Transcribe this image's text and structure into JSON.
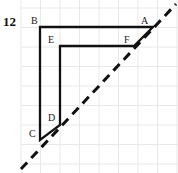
{
  "figure": {
    "problem_number": "12",
    "background_color": "#ffffff",
    "width": 178,
    "height": 173
  },
  "grid": {
    "color": "#e8e8ea",
    "line_width": 1,
    "spacing": 19.5,
    "x_start": 21,
    "y_start": 8,
    "columns": 8,
    "rows": 8,
    "visible": true
  },
  "shape": {
    "name": "L-shaped-hexagon",
    "stroke_color": "#111111",
    "stroke_width": 2.3,
    "fill": "none",
    "points": [
      {
        "label": "B",
        "x": 40,
        "y": 27
      },
      {
        "label": "A",
        "x": 153,
        "y": 27
      },
      {
        "label": "F",
        "x": 134,
        "y": 46
      },
      {
        "label": "E",
        "x": 60,
        "y": 46
      },
      {
        "label": "D",
        "x": 60,
        "y": 125
      },
      {
        "label": "C",
        "x": 40,
        "y": 140
      }
    ],
    "segments": [
      {
        "from": "B",
        "to": "A"
      },
      {
        "from": "A",
        "to": "F"
      },
      {
        "from": "F",
        "to": "E"
      },
      {
        "from": "E",
        "to": "D"
      },
      {
        "from": "D",
        "to": "C"
      },
      {
        "from": "C",
        "to": "B"
      }
    ]
  },
  "diagonal": {
    "name": "dashed-diagonal-line",
    "stroke_color": "#111111",
    "stroke_width": 3,
    "dash_pattern": "9 6",
    "x1": 21,
    "y1": 169,
    "x2": 176,
    "y2": 4
  },
  "labels": [
    {
      "text": "B",
      "x": 31,
      "y": 16
    },
    {
      "text": "A",
      "x": 141,
      "y": 16
    },
    {
      "text": "E",
      "x": 48,
      "y": 35
    },
    {
      "text": "F",
      "x": 124,
      "y": 35
    },
    {
      "text": "D",
      "x": 48,
      "y": 113
    },
    {
      "text": "C",
      "x": 29,
      "y": 129
    }
  ]
}
